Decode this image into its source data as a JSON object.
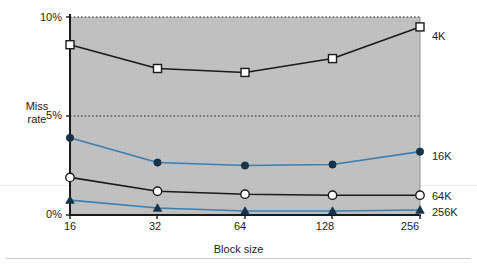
{
  "chart_data": {
    "type": "line",
    "title": "",
    "xlabel": "Block size",
    "ylabel": "Miss rate",
    "categories": [
      "16",
      "32",
      "64",
      "128",
      "256"
    ],
    "x_tick_labels": [
      "16",
      "32",
      "64",
      "128",
      "256"
    ],
    "y_tick_labels": [
      "0%",
      "5%",
      "10%"
    ],
    "y_tick_values": [
      0,
      5,
      10
    ],
    "ylim": [
      0,
      10.2
    ],
    "grid": "horizontal-dotted",
    "legend_position": "right-of-plot",
    "plot_background": "#c0c0c0",
    "series": [
      {
        "name": "4K",
        "label": "4K",
        "values": [
          8.6,
          7.4,
          7.2,
          7.9,
          9.5
        ],
        "color": "#1a1a1a",
        "marker": "open-square"
      },
      {
        "name": "16K",
        "label": "16K",
        "values": [
          3.9,
          2.65,
          2.5,
          2.55,
          3.2
        ],
        "color": "#3a7fb0",
        "marker": "filled-circle"
      },
      {
        "name": "64K",
        "label": "64K",
        "values": [
          1.9,
          1.2,
          1.05,
          1.0,
          1.0
        ],
        "color": "#1a1a1a",
        "marker": "open-circle"
      },
      {
        "name": "256K",
        "label": "256K",
        "values": [
          0.75,
          0.35,
          0.2,
          0.2,
          0.25
        ],
        "color": "#3a7fb0",
        "marker": "filled-triangle"
      }
    ]
  },
  "axes": {
    "y_label_line1": "Miss",
    "y_label_line2": "rate",
    "y_tick_10": "10%",
    "y_tick_5": "5%",
    "y_tick_0": "0%",
    "x_title": "Block size",
    "x_tick_0": "16",
    "x_tick_1": "32",
    "x_tick_2": "64",
    "x_tick_3": "128",
    "x_tick_4": "256"
  },
  "legend": {
    "item_4k": "4K",
    "item_16k": "16K",
    "item_64k": "64K",
    "item_256k": "256K"
  },
  "colors": {
    "plot_bg": "#c0c0c0",
    "black_series": "#1a1a1a",
    "blue_series": "#3a7fb0",
    "page_bg": "#ffffff"
  }
}
